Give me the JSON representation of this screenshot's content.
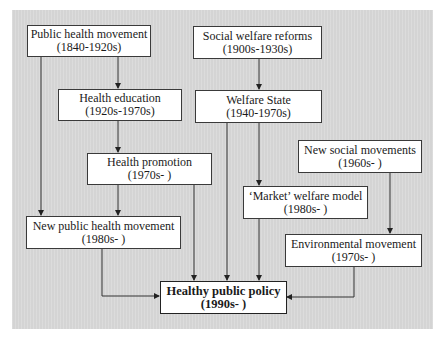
{
  "diagram": {
    "nodes": [
      {
        "id": "public_health",
        "title": "Public health movement",
        "period": "(1840-1920s)"
      },
      {
        "id": "health_education",
        "title": "Health education",
        "period": "(1920s-1970s)"
      },
      {
        "id": "health_promotion",
        "title": "Health promotion",
        "period": "(1970s- )"
      },
      {
        "id": "new_public_health",
        "title": "New public health movement",
        "period": "(1980s- )"
      },
      {
        "id": "social_welfare",
        "title": "Social welfare reforms",
        "period": "(1900s-1930s)"
      },
      {
        "id": "welfare_state",
        "title": "Welfare State",
        "period": "(1940-1970s)"
      },
      {
        "id": "new_social",
        "title": "New social movements",
        "period": "(1960s- )"
      },
      {
        "id": "market_welfare",
        "title": "‘Market’ welfare model",
        "period": "(1980s- )"
      },
      {
        "id": "environmental",
        "title": "Environmental movement",
        "period": "(1970s- )"
      },
      {
        "id": "healthy_policy",
        "title": "Healthy public policy",
        "period": "(1990s- )"
      }
    ],
    "edges": [
      [
        "public_health",
        "health_education"
      ],
      [
        "public_health",
        "new_public_health"
      ],
      [
        "health_education",
        "health_promotion"
      ],
      [
        "health_promotion",
        "new_public_health"
      ],
      [
        "health_promotion",
        "healthy_policy"
      ],
      [
        "new_public_health",
        "healthy_policy"
      ],
      [
        "social_welfare",
        "welfare_state"
      ],
      [
        "welfare_state",
        "market_welfare"
      ],
      [
        "welfare_state",
        "healthy_policy"
      ],
      [
        "market_welfare",
        "healthy_policy"
      ],
      [
        "new_social",
        "environmental"
      ],
      [
        "environmental",
        "healthy_policy"
      ]
    ]
  }
}
